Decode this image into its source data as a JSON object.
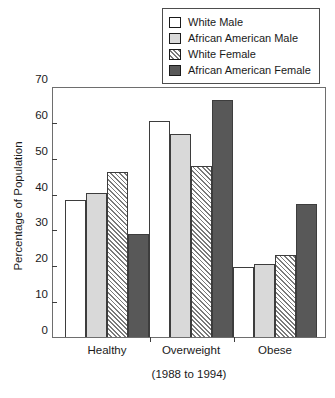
{
  "chart_data": {
    "type": "bar",
    "title": "",
    "subtitle": "",
    "xlabel": "(1988 to 1994)",
    "ylabel": "Percentage of Population",
    "categories": [
      "Healthy",
      "Overweight",
      "Obese"
    ],
    "ylim": [
      0,
      70
    ],
    "yticks": [
      0,
      10,
      20,
      30,
      40,
      50,
      60,
      70
    ],
    "grid": false,
    "legend_position": "top-right",
    "series": [
      {
        "name": "White Male",
        "fill": "white",
        "color": "#ffffff",
        "values": [
          38.3,
          60.2,
          19.6
        ]
      },
      {
        "name": "African American Male",
        "fill": "light-gray",
        "color": "#d9d9d9",
        "values": [
          40.2,
          56.6,
          20.3
        ]
      },
      {
        "name": "White Female",
        "fill": "hatched",
        "color": "#ffffff",
        "values": [
          46.1,
          47.7,
          22.8
        ]
      },
      {
        "name": "African American Female",
        "fill": "dark-gray",
        "color": "#585858",
        "values": [
          28.8,
          66.1,
          37.0
        ]
      }
    ]
  }
}
